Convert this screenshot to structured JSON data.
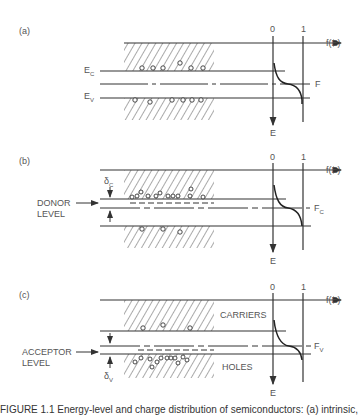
{
  "figure": {
    "caption": "FIGURE 1.1  Energy-level and charge distribution of semiconductors: (a) intrinsic, (b) n-type, (c) p-type."
  },
  "axis": {
    "zero_label": "0",
    "one_label": "1",
    "x_label": "f(E)",
    "y_label": "E"
  },
  "panels": [
    {
      "id": "a",
      "label": "(a)",
      "conduction_label": "E",
      "conduction_sub": "C",
      "valence_label": "E",
      "valence_sub": "V",
      "fermi_label": "F",
      "fermi_sub": ""
    },
    {
      "id": "b",
      "label": "(b)",
      "level_label_1": "DONOR",
      "level_label_2": "LEVEL",
      "delta_label": "δ",
      "delta_sub": "C",
      "fermi_label": "F",
      "fermi_sub": "C"
    },
    {
      "id": "c",
      "label": "(c)",
      "level_label_1": "ACCEPTOR",
      "level_label_2": "LEVEL",
      "delta_label": "δ",
      "delta_sub": "V",
      "fermi_label": "F",
      "fermi_sub": "V",
      "carriers_label": "CARRIERS",
      "holes_label": "HOLES"
    }
  ],
  "colors": {
    "line": "#333333",
    "text": "#555555",
    "background": "#ffffff"
  }
}
